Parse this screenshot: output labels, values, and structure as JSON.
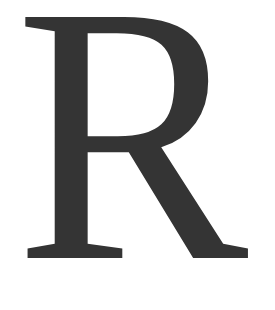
{
  "letter": {
    "character": "R",
    "color": "#343434",
    "background": "#ffffff"
  }
}
